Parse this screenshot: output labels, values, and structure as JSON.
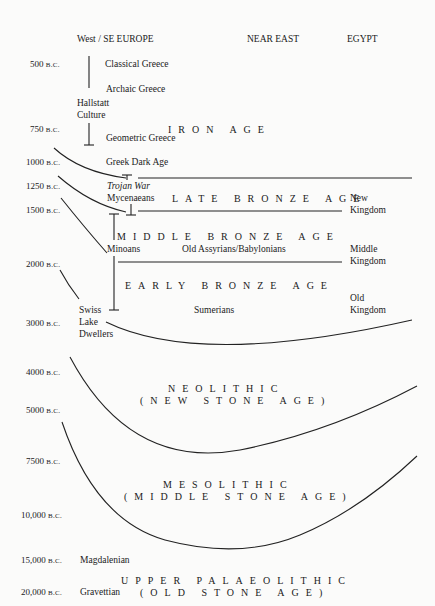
{
  "header": {
    "col_west": "West / SE EUROPE",
    "col_near_east": "NEAR EAST",
    "col_egypt": "EGYPT"
  },
  "dates": [
    {
      "num": "500",
      "era": "B.C."
    },
    {
      "num": "750",
      "era": "B.C."
    },
    {
      "num": "1000",
      "era": "B.C."
    },
    {
      "num": "1250",
      "era": "B.C."
    },
    {
      "num": "1500",
      "era": "B.C."
    },
    {
      "num": "2000",
      "era": "B.C."
    },
    {
      "num": "3000",
      "era": "B.C."
    },
    {
      "num": "4000",
      "era": "B.C."
    },
    {
      "num": "5000",
      "era": "B.C."
    },
    {
      "num": "7500",
      "era": "B.C."
    },
    {
      "num": "10,000",
      "era": "B.C."
    },
    {
      "num": "15,000",
      "era": "B.C."
    },
    {
      "num": "20,000",
      "era": "B.C."
    }
  ],
  "ages": {
    "iron": "IRON AGE",
    "late_bronze": "LATE BRONZE AGE",
    "middle_bronze": "MIDDLE BRONZE AGE",
    "early_bronze": "EARLY BRONZE AGE",
    "neolithic": "NEOLITHIC",
    "neolithic_sub": "(NEW STONE AGE)",
    "mesolithic": "MESOLITHIC",
    "mesolithic_sub": "(MIDDLE STONE AGE)",
    "upper_palaeolithic": "UPPER PALAEOLITHIC",
    "upper_palaeolithic_sub": "(OLD STONE AGE)"
  },
  "cultures": {
    "classical_greece": "Classical Greece",
    "archaic_greece": "Archaic Greece",
    "hallstatt_1": "Hallstatt",
    "hallstatt_2": "Culture",
    "geometric_greece": "Geometric Greece",
    "greek_dark_age": "Greek Dark Age",
    "trojan_war": "Trojan War",
    "mycenaeans": "Mycenaeans",
    "minoans": "Minoans",
    "old_assyrians": "Old Assyrians/Babylonians",
    "sumerians": "Sumerians",
    "swiss_1": "Swiss",
    "swiss_2": "Lake",
    "swiss_3": "Dwellers",
    "magdalenian": "Magdalenian",
    "gravettian": "Gravettian"
  },
  "egypt": {
    "new_1": "New",
    "new_2": "Kingdom",
    "middle_1": "Middle",
    "middle_2": "Kingdom",
    "old_1": "Old",
    "old_2": "Kingdom"
  }
}
